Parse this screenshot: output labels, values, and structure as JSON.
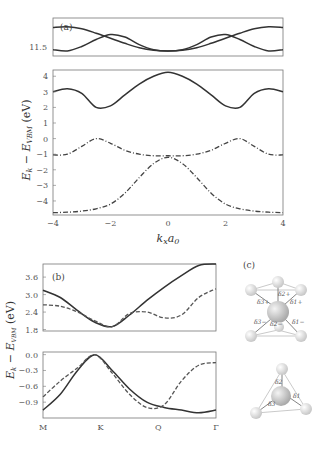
{
  "chart_data": [
    {
      "panel": "(a)",
      "type": "line",
      "subpanels": [
        {
          "name": "upper",
          "ylim": [
            11.3,
            11.9
          ],
          "yticks": [
            "11.5"
          ],
          "series": [
            {
              "name": "band-upper-1",
              "style": "solid",
              "x": [
                -4,
                -3.5,
                -3,
                -2.5,
                -2,
                -1.5,
                -1,
                -0.5,
                0,
                0.5,
                1,
                1.5,
                2,
                2.5,
                3,
                3.5,
                4
              ],
              "y": [
                11.75,
                11.76,
                11.73,
                11.66,
                11.58,
                11.5,
                11.43,
                11.39,
                11.38,
                11.39,
                11.43,
                11.5,
                11.58,
                11.66,
                11.73,
                11.76,
                11.75
              ]
            },
            {
              "name": "band-upper-2",
              "style": "solid",
              "x": [
                -4,
                -3.5,
                -3,
                -2.5,
                -2,
                -1.5,
                -1,
                -0.5,
                0,
                0.5,
                1,
                1.5,
                2,
                2.5,
                3,
                3.5,
                4
              ],
              "y": [
                11.4,
                11.38,
                11.45,
                11.56,
                11.64,
                11.6,
                11.48,
                11.4,
                11.38,
                11.4,
                11.48,
                11.6,
                11.64,
                11.56,
                11.45,
                11.38,
                11.4
              ]
            }
          ]
        },
        {
          "name": "lower",
          "ylim": [
            -4.9,
            4.4
          ],
          "yticks": [
            "4",
            "3",
            "2",
            "1",
            "0",
            "−1",
            "−2",
            "−3",
            "−4"
          ],
          "series": [
            {
              "name": "conduction",
              "style": "solid",
              "x": [
                -4,
                -3.5,
                -3,
                -2.5,
                -2,
                -1.5,
                -1,
                -0.5,
                0,
                0.5,
                1,
                1.5,
                2,
                2.5,
                3,
                3.5,
                4
              ],
              "y": [
                3.0,
                3.2,
                2.9,
                2.0,
                2.1,
                2.8,
                3.5,
                4.0,
                4.25,
                4.0,
                3.5,
                2.8,
                2.1,
                2.0,
                2.9,
                3.2,
                3.0
              ]
            },
            {
              "name": "valence-top",
              "style": "dashdot",
              "x": [
                -4,
                -3.5,
                -3,
                -2.5,
                -2,
                -1.5,
                -1,
                -0.5,
                0,
                0.5,
                1,
                1.5,
                2,
                2.5,
                3,
                3.5,
                4
              ],
              "y": [
                -1.05,
                -1.0,
                -0.5,
                0.0,
                -0.3,
                -0.75,
                -1.0,
                -1.1,
                -1.1,
                -1.1,
                -1.0,
                -0.75,
                -0.3,
                0.0,
                -0.5,
                -1.0,
                -1.05
              ]
            },
            {
              "name": "valence-lower",
              "style": "dashdot",
              "x": [
                -4,
                -3.5,
                -3,
                -2.5,
                -2,
                -1.5,
                -1,
                -0.5,
                0,
                0.5,
                1,
                1.5,
                2,
                2.5,
                3,
                3.5,
                4
              ],
              "y": [
                -4.75,
                -4.72,
                -4.65,
                -4.5,
                -4.2,
                -3.5,
                -2.5,
                -1.6,
                -1.2,
                -1.6,
                -2.5,
                -3.5,
                -4.2,
                -4.5,
                -4.65,
                -4.72,
                -4.75
              ]
            }
          ]
        }
      ],
      "xlim": [
        -4,
        4
      ],
      "xticks": [
        "−4",
        "−2",
        "0",
        "2",
        "4"
      ],
      "xlabel": "k_x a_0",
      "ylabel": "E_k − E_VBM (eV)"
    },
    {
      "panel": "(b)",
      "type": "line",
      "subpanels": [
        {
          "name": "upper",
          "ylim": [
            1.75,
            4.05
          ],
          "yticks": [
            "3.6",
            "3.0",
            "2.4",
            "1.8"
          ],
          "series": [
            {
              "name": "conduction-solid",
              "style": "solid",
              "x": [
                0,
                0.1,
                0.2,
                0.3,
                0.4,
                0.5,
                0.6,
                0.7,
                0.8,
                0.9,
                1.0
              ],
              "y": [
                3.15,
                2.9,
                2.45,
                2.05,
                1.9,
                2.3,
                2.8,
                3.25,
                3.65,
                4.0,
                4.2
              ]
            },
            {
              "name": "conduction-dashed",
              "style": "dash",
              "x": [
                0,
                0.1,
                0.2,
                0.3,
                0.4,
                0.5,
                0.6,
                0.7,
                0.8,
                0.9,
                1.0
              ],
              "y": [
                2.65,
                2.6,
                2.4,
                2.1,
                1.9,
                2.35,
                2.4,
                2.2,
                2.3,
                2.9,
                3.2
              ]
            }
          ]
        },
        {
          "name": "lower",
          "ylim": [
            -1.2,
            0.05
          ],
          "yticks": [
            "0.0",
            "−0.3",
            "−0.6",
            "−0.9"
          ],
          "series": [
            {
              "name": "valence-solid",
              "style": "solid",
              "x": [
                0,
                0.1,
                0.2,
                0.3,
                0.4,
                0.5,
                0.6,
                0.7,
                0.8,
                0.9,
                1.0
              ],
              "y": [
                -1.05,
                -0.75,
                -0.3,
                0.0,
                -0.3,
                -0.65,
                -0.9,
                -1.0,
                -1.05,
                -1.1,
                -1.05
              ]
            },
            {
              "name": "valence-dashed",
              "style": "dash",
              "x": [
                0,
                0.1,
                0.2,
                0.3,
                0.4,
                0.5,
                0.6,
                0.7,
                0.8,
                0.9,
                1.0
              ],
              "y": [
                -0.8,
                -0.5,
                -0.25,
                0.0,
                -0.35,
                -0.75,
                -1.0,
                -0.95,
                -0.5,
                -0.2,
                -0.15
              ]
            }
          ]
        }
      ],
      "xticks": [
        "M",
        "K",
        "Q",
        "Γ"
      ],
      "xtick_pos": [
        0,
        0.333,
        0.667,
        1.0
      ],
      "ylabel": "E_k − E_VBM (eV)"
    }
  ],
  "panel_c": {
    "label": "(c)",
    "top_labels": [
      "δ2+",
      "δ3+",
      "δ1+",
      "δ3−",
      "δ2−",
      "δ1−"
    ],
    "bottom_labels": [
      "δ2",
      "δ1",
      "δ3"
    ]
  }
}
